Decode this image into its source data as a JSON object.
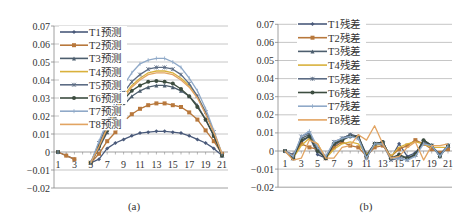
{
  "figure": {
    "captions": [
      "(a)",
      "(b)"
    ]
  },
  "chart_data": [
    {
      "type": "line",
      "title": "",
      "caption": "(a)",
      "xlabel": "",
      "ylabel": "",
      "x": [
        1,
        2,
        3,
        4,
        5,
        6,
        7,
        8,
        9,
        10,
        11,
        12,
        13,
        14,
        15,
        16,
        17,
        18,
        19,
        20,
        21
      ],
      "x_tick_labels": [
        "1",
        "3",
        "5",
        "7",
        "9",
        "11",
        "13",
        "15",
        "17",
        "19",
        "21"
      ],
      "y_tick_labels": [
        "0.07",
        "0.06",
        "0.05",
        "0.04",
        "0.03",
        "0.02",
        "0.01",
        "0",
        "-0.01",
        "-0.02"
      ],
      "ylim": [
        -0.02,
        0.07
      ],
      "grid": true,
      "legend_position": "upper-left",
      "series": [
        {
          "name": "T1预测",
          "color": "#4a5a7a",
          "marker": "diamond",
          "values": [
            0,
            -0.002,
            -0.004,
            null,
            -0.006,
            -0.004,
            0.002,
            0.005,
            0.007,
            0.009,
            0.0105,
            0.011,
            0.0115,
            0.0115,
            0.011,
            0.0105,
            0.009,
            0.007,
            0.005,
            0.002,
            -0.002
          ]
        },
        {
          "name": "T2预测",
          "color": "#b8783c",
          "marker": "square",
          "values": [
            0,
            -0.002,
            -0.004,
            null,
            -0.006,
            -0.001,
            0.006,
            0.011,
            0.017,
            0.021,
            0.024,
            0.026,
            0.027,
            0.027,
            0.026,
            0.025,
            0.022,
            0.018,
            0.012,
            0.006,
            -0.001
          ]
        },
        {
          "name": "T3预测",
          "color": "#4d5e6e",
          "marker": "triangle",
          "values": [
            0,
            null,
            null,
            null,
            -0.006,
            0.002,
            0.011,
            0.019,
            0.026,
            0.031,
            0.034,
            0.036,
            0.037,
            0.037,
            0.036,
            0.034,
            0.031,
            0.026,
            0.018,
            0.009,
            -0.002
          ]
        },
        {
          "name": "T4预测",
          "color": "#d9b13c",
          "marker": "none",
          "values": [
            0,
            null,
            null,
            null,
            -0.006,
            0.004,
            0.014,
            0.023,
            0.031,
            0.037,
            0.041,
            0.044,
            0.045,
            0.045,
            0.044,
            0.041,
            0.037,
            0.031,
            0.022,
            0.011,
            -0.001
          ]
        },
        {
          "name": "T5预测",
          "color": "#5c6c84",
          "marker": "star",
          "values": [
            0,
            null,
            null,
            null,
            -0.006,
            0.005,
            0.015,
            0.025,
            0.033,
            0.039,
            0.043,
            0.046,
            0.047,
            0.047,
            0.046,
            0.043,
            0.038,
            0.031,
            0.022,
            0.011,
            -0.002
          ]
        },
        {
          "name": "T6预测",
          "color": "#3d4d40",
          "marker": "circle",
          "values": [
            0,
            null,
            null,
            null,
            -0.006,
            0.003,
            0.012,
            0.021,
            0.029,
            0.034,
            0.037,
            0.039,
            0.0395,
            0.039,
            0.038,
            0.035,
            0.031,
            0.025,
            0.018,
            0.009,
            -0.002
          ]
        },
        {
          "name": "T7预测",
          "color": "#8fa9c8",
          "marker": "plus",
          "values": [
            0,
            null,
            null,
            null,
            -0.006,
            0.006,
            0.017,
            0.028,
            0.037,
            0.044,
            0.049,
            0.051,
            0.052,
            0.052,
            0.05,
            0.047,
            0.041,
            0.034,
            0.024,
            0.012,
            -0.001
          ]
        },
        {
          "name": "T8预测",
          "color": "#e2a462",
          "marker": "none",
          "values": [
            0,
            null,
            null,
            null,
            -0.006,
            0.003,
            0.013,
            0.022,
            0.03,
            0.036,
            0.04,
            0.043,
            0.044,
            0.044,
            0.043,
            0.04,
            0.036,
            0.03,
            0.021,
            0.011,
            -0.001
          ]
        }
      ]
    },
    {
      "type": "line",
      "title": "",
      "caption": "(b)",
      "xlabel": "",
      "ylabel": "",
      "x": [
        1,
        2,
        3,
        4,
        5,
        6,
        7,
        8,
        9,
        10,
        11,
        12,
        13,
        14,
        15,
        16,
        17,
        18,
        19,
        20,
        21
      ],
      "x_tick_labels": [
        "1",
        "3",
        "5",
        "7",
        "9",
        "11",
        "13",
        "15",
        "17",
        "19",
        "21"
      ],
      "y_tick_labels": [
        "0.07",
        "0.06",
        "0.05",
        "0.04",
        "0.03",
        "0.02",
        "0.01",
        "0",
        "-0.01",
        "-0.02"
      ],
      "ylim": [
        -0.02,
        0.07
      ],
      "grid": true,
      "legend_position": "upper-left",
      "series": [
        {
          "name": "T1残差",
          "color": "#4a5a7a",
          "marker": "diamond",
          "values": [
            0,
            -0.002,
            0.005,
            0.008,
            -0.002,
            -0.004,
            0.003,
            0.006,
            0.009,
            0.008,
            -0.002,
            0.004,
            0.005,
            -0.004,
            0.004,
            -0.003,
            -0.001,
            0.005,
            0.002,
            -0.002,
            0.003
          ]
        },
        {
          "name": "T2残差",
          "color": "#b8783c",
          "marker": "square",
          "values": [
            0,
            -0.003,
            0.004,
            0.002,
            0.001,
            -0.004,
            0.002,
            0.005,
            0.003,
            0.002,
            -0.003,
            0.002,
            0.003,
            -0.003,
            0.001,
            0.003,
            0.006,
            0.004,
            0.001,
            -0.001,
            0.001
          ]
        },
        {
          "name": "T3残差",
          "color": "#4d5e6e",
          "marker": "triangle",
          "values": [
            0,
            -0.004,
            0.007,
            0.009,
            0.002,
            -0.003,
            0.004,
            0.007,
            0.009,
            0.008,
            -0.003,
            0.004,
            0.005,
            -0.004,
            -0.003,
            -0.004,
            -0.002,
            0.006,
            0.003,
            -0.002,
            0.003
          ]
        },
        {
          "name": "T4残差",
          "color": "#d9b13c",
          "marker": "none",
          "values": [
            0,
            -0.004,
            0.003,
            0.007,
            0.004,
            -0.004,
            0.001,
            0.004,
            0.005,
            0.004,
            -0.002,
            0.003,
            0.004,
            -0.003,
            0.002,
            0.004,
            0.005,
            0.004,
            0.002,
            0.002,
            0.002
          ]
        },
        {
          "name": "T5残差",
          "color": "#5c6c84",
          "marker": "star",
          "values": [
            0,
            -0.004,
            0.008,
            0.01,
            0.001,
            -0.004,
            0.005,
            0.007,
            0.009,
            0.007,
            -0.004,
            0.004,
            0.004,
            -0.005,
            -0.004,
            -0.005,
            -0.002,
            0.005,
            0.003,
            -0.003,
            0.003
          ]
        },
        {
          "name": "T6残差",
          "color": "#3d4d40",
          "marker": "circle",
          "values": [
            0,
            -0.004,
            0.006,
            0.008,
            0.0,
            -0.004,
            0.004,
            0.006,
            0.008,
            0.008,
            -0.003,
            0.004,
            0.005,
            -0.004,
            -0.002,
            -0.004,
            -0.002,
            0.006,
            0.003,
            -0.003,
            0.003
          ]
        },
        {
          "name": "T7残差",
          "color": "#8fa9c8",
          "marker": "plus",
          "values": [
            0,
            -0.003,
            0.008,
            0.011,
            0.002,
            -0.003,
            0.005,
            0.007,
            0.008,
            0.007,
            -0.004,
            0.004,
            0.004,
            -0.004,
            -0.004,
            -0.005,
            -0.003,
            0.004,
            0.003,
            -0.003,
            0.003
          ]
        },
        {
          "name": "T8残差",
          "color": "#e2a462",
          "marker": "none",
          "values": [
            0,
            -0.005,
            -0.004,
            0.006,
            0.004,
            -0.004,
            -0.004,
            0.002,
            0.003,
            0.009,
            0.006,
            0.014,
            0.004,
            -0.004,
            -0.003,
            0.002,
            0.005,
            -0.005,
            0.003,
            0.003,
            0.004
          ]
        }
      ]
    }
  ]
}
